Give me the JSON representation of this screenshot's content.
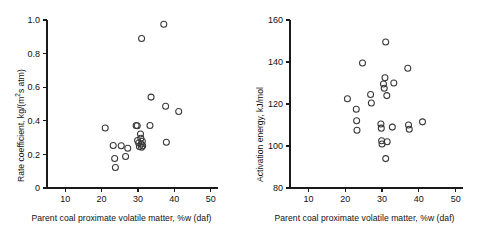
{
  "figure": {
    "background": "#ffffff",
    "marker_color": "#3a3a3a",
    "axis_color": "#1a1a1a"
  },
  "panels": [
    {
      "name": "rate-coefficient-panel",
      "xlabel_pre": "Parent coal proximate volatile  matter, %w (daf)",
      "ylabel_pre": "Rate coefficient, kg/(m",
      "ylabel_sup": "2",
      "ylabel_post": "s atm)",
      "xticks": [
        "10",
        "20",
        "30",
        "40",
        "50"
      ],
      "yticks": [
        "0",
        "0.2",
        "0.4",
        "0.6",
        "0.8",
        "1.0"
      ]
    },
    {
      "name": "activation-energy-panel",
      "xlabel_pre": "Parent coal proximate volatile matter, %w (daf)",
      "ylabel_pre": "Activation energy, kJ/mol",
      "ylabel_sup": "",
      "ylabel_post": "",
      "xticks": [
        "10",
        "20",
        "30",
        "40",
        "50"
      ],
      "yticks": [
        "80",
        "100",
        "120",
        "140",
        "160"
      ]
    }
  ],
  "chart_data": [
    {
      "type": "scatter",
      "title": "",
      "xlabel": "Parent coal proximate volatile  matter, %w (daf)",
      "ylabel": "Rate coefficient, kg/(m^2 s atm)",
      "xlim": [
        5,
        52
      ],
      "ylim": [
        0,
        1.0
      ],
      "xticks": [
        10,
        20,
        30,
        40,
        50
      ],
      "yticks": [
        0,
        0.2,
        0.4,
        0.6,
        0.8,
        1.0
      ],
      "grid": false,
      "legend": "none",
      "marker": "open-circle",
      "points": [
        [
          21.0,
          0.357
        ],
        [
          23.2,
          0.253
        ],
        [
          23.6,
          0.176
        ],
        [
          23.8,
          0.122
        ],
        [
          25.4,
          0.252
        ],
        [
          26.6,
          0.188
        ],
        [
          27.2,
          0.237
        ],
        [
          29.5,
          0.372
        ],
        [
          29.8,
          0.37
        ],
        [
          29.9,
          0.283
        ],
        [
          30.2,
          0.268
        ],
        [
          30.4,
          0.247
        ],
        [
          30.7,
          0.322
        ],
        [
          30.8,
          0.296
        ],
        [
          30.9,
          0.262
        ],
        [
          31.0,
          0.243
        ],
        [
          31.2,
          0.278
        ],
        [
          31.3,
          0.252
        ],
        [
          31.0,
          0.89
        ],
        [
          33.3,
          0.372
        ],
        [
          33.6,
          0.541
        ],
        [
          37.1,
          0.975
        ],
        [
          37.6,
          0.487
        ],
        [
          37.8,
          0.272
        ],
        [
          41.2,
          0.455
        ]
      ]
    },
    {
      "type": "scatter",
      "title": "",
      "xlabel": "Parent coal proximate volatile matter, %w (daf)",
      "ylabel": "Activation energy, kJ/mol",
      "xlim": [
        5,
        52
      ],
      "ylim": [
        80,
        160
      ],
      "xticks": [
        10,
        20,
        30,
        40,
        50
      ],
      "yticks": [
        80,
        100,
        120,
        140,
        160
      ],
      "grid": false,
      "legend": "none",
      "marker": "open-circle",
      "points": [
        [
          20.6,
          122.5
        ],
        [
          23.0,
          117.5
        ],
        [
          23.1,
          112.0
        ],
        [
          23.2,
          107.5
        ],
        [
          24.7,
          139.5
        ],
        [
          26.9,
          124.5
        ],
        [
          27.1,
          120.5
        ],
        [
          29.7,
          110.5
        ],
        [
          29.8,
          108.5
        ],
        [
          29.9,
          102.5
        ],
        [
          30.0,
          101.0
        ],
        [
          30.4,
          129.5
        ],
        [
          30.6,
          127.5
        ],
        [
          30.8,
          132.5
        ],
        [
          31.0,
          149.5
        ],
        [
          31.3,
          124.0
        ],
        [
          31.4,
          102.0
        ],
        [
          31.0,
          94.0
        ],
        [
          32.8,
          109.0
        ],
        [
          33.2,
          130.0
        ],
        [
          37.0,
          137.0
        ],
        [
          37.2,
          110.0
        ],
        [
          37.4,
          108.0
        ],
        [
          41.0,
          111.5
        ]
      ]
    }
  ]
}
